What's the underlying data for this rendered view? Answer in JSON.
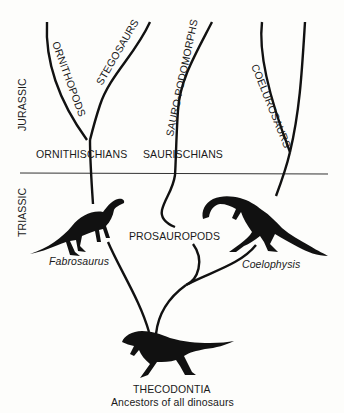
{
  "diagram": {
    "type": "phylogenetic-tree",
    "periods": {
      "upper": "JURASSIC",
      "lower": "TRIASSIC"
    },
    "branches": {
      "ornithopods": "ORNITHOPODS",
      "stegosaurs": "STEGOSAURS",
      "sauropodomorphs": "SAURO-PODOMORPHS",
      "coelurosaurs": "COELUROSAURS"
    },
    "groups": {
      "ornithischians": "ORNITHISCHIANS",
      "saurischians": "SAURISCHIANS",
      "prosauropods": "PROSAUROPODS"
    },
    "genera": {
      "fabrosaurus": "Fabrosaurus",
      "coelophysis": "Coelophysis"
    },
    "root": {
      "name": "THECODONTIA",
      "description": "Ancestors of all dinosaurs"
    },
    "colors": {
      "ink": "#111111",
      "divider": "#333333",
      "background": "#fdfdfb"
    }
  }
}
